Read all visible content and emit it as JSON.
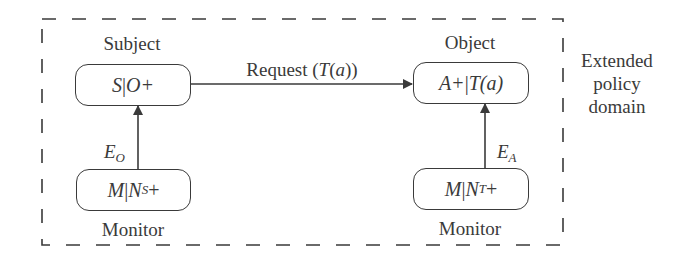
{
  "diagram": {
    "boundary": {
      "label_lines": [
        "Extended",
        "policy",
        "domain"
      ],
      "style": "dashed"
    },
    "nodes": {
      "subject": {
        "title": "Subject",
        "main": "S",
        "sep": " | ",
        "rest": "O+"
      },
      "object": {
        "title": "Object",
        "main": "A+",
        "sep": " | ",
        "rest": "T(a)"
      },
      "monitor_left": {
        "title": "Monitor",
        "main": "M",
        "sep": "| ",
        "rest": "N",
        "sub": "S",
        "suffix": "+"
      },
      "monitor_right": {
        "title": "Monitor",
        "main": "M",
        "sep": " | ",
        "rest": "N",
        "sub": "T",
        "suffix": "+"
      }
    },
    "edges": {
      "request": {
        "label_prefix": "Request (",
        "label_italic": "T",
        "label_mid": "(",
        "label_arg": "a",
        "label_suffix": "))",
        "from": "subject",
        "to": "object"
      },
      "e_o": {
        "label": "E",
        "sub": "O",
        "from": "monitor_left",
        "to": "subject"
      },
      "e_a": {
        "label": "E",
        "sub": "A",
        "from": "monitor_right",
        "to": "object"
      }
    },
    "colors": {
      "ink": "#3a3a3a",
      "background": "#ffffff"
    }
  }
}
